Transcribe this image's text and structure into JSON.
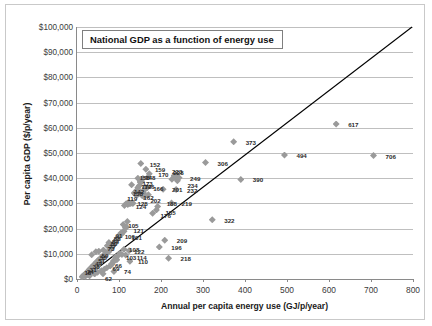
{
  "chart": {
    "title": "National GDP as a function of energy use",
    "xlabel": "Annual per capita energy use (GJ/p/year)",
    "ylabel": "Per capita GDP ($/p/year)"
  },
  "chart_data": {
    "type": "scatter",
    "title": "National GDP as a function of energy use",
    "xlabel": "Annual per capita energy use (GJ/p/year)",
    "ylabel": "Per capita GDP ($/p/year)",
    "xlim": [
      0,
      800
    ],
    "ylim": [
      0,
      100000
    ],
    "xticks": [
      0,
      100,
      200,
      300,
      400,
      500,
      600,
      700,
      800
    ],
    "yticks": [
      0,
      10000,
      20000,
      30000,
      40000,
      50000,
      60000,
      70000,
      80000,
      90000,
      100000
    ],
    "ytick_labels": [
      "$0",
      "$10,000",
      "$20,000",
      "$30,000",
      "$40,000",
      "$50,000",
      "$60,000",
      "$70,000",
      "$80,000",
      "$90,000",
      "$100,000"
    ],
    "xtick_labels": [
      "0",
      "100",
      "200",
      "300",
      "400",
      "500",
      "600",
      "700",
      "800"
    ],
    "grid": "horizontal",
    "legend": "none",
    "marker": "diamond",
    "marker_color": "#9a9a9a",
    "trendline": {
      "shown": true,
      "color": "#000000",
      "x": [
        18,
        800
      ],
      "y": [
        0,
        100000
      ]
    },
    "points": [
      {
        "label": "706",
        "x": 706,
        "y": 49000,
        "lx": 12,
        "ly": 0
      },
      {
        "label": "617",
        "x": 617,
        "y": 61500,
        "lx": 12,
        "ly": 0
      },
      {
        "label": "494",
        "x": 494,
        "y": 49200,
        "lx": 12,
        "ly": 0
      },
      {
        "label": "390",
        "x": 390,
        "y": 39500,
        "lx": 12,
        "ly": 0
      },
      {
        "label": "373",
        "x": 373,
        "y": 54500,
        "lx": 12,
        "ly": 0
      },
      {
        "label": "322",
        "x": 322,
        "y": 23500,
        "lx": 12,
        "ly": 0
      },
      {
        "label": "306",
        "x": 306,
        "y": 46200,
        "lx": 12,
        "ly": 0
      },
      {
        "label": "218",
        "x": 218,
        "y": 8200,
        "lx": 12,
        "ly": 0
      },
      {
        "label": "209",
        "x": 209,
        "y": 15400,
        "lx": 12,
        "ly": 0
      },
      {
        "label": "196",
        "x": 196,
        "y": 12700,
        "lx": 12,
        "ly": 0
      },
      {
        "label": "232",
        "x": 236,
        "y": 35500,
        "lx": 11,
        "ly": 0
      },
      {
        "label": "249",
        "x": 243,
        "y": 40200,
        "lx": 11,
        "ly": 0
      },
      {
        "label": "234",
        "x": 239,
        "y": 39000,
        "lx": 10,
        "ly": 4
      },
      {
        "label": "228",
        "x": 234,
        "y": 40400,
        "lx": -2,
        "ly": -5
      },
      {
        "label": "223",
        "x": 231,
        "y": 41000,
        "lx": -2,
        "ly": -5
      },
      {
        "label": "219",
        "x": 225,
        "y": 30200,
        "lx": 10,
        "ly": 0
      },
      {
        "label": "201",
        "x": 205,
        "y": 35600,
        "lx": 9,
        "ly": 0
      },
      {
        "label": "188",
        "x": 192,
        "y": 28800,
        "lx": 9,
        "ly": -3
      },
      {
        "label": "185",
        "x": 189,
        "y": 27400,
        "lx": 9,
        "ly": 2
      },
      {
        "label": "176",
        "x": 180,
        "y": 26100,
        "lx": 8,
        "ly": 2
      },
      {
        "label": "170",
        "x": 172,
        "y": 41800,
        "lx": 9,
        "ly": 0
      },
      {
        "label": "159",
        "x": 164,
        "y": 43600,
        "lx": 9,
        "ly": 0
      },
      {
        "label": "152",
        "x": 152,
        "y": 45800,
        "lx": 9,
        "ly": 0
      },
      {
        "label": "173",
        "x": 163,
        "y": 36300,
        "lx": -3,
        "ly": -5
      },
      {
        "label": "172",
        "x": 160,
        "y": 35200,
        "lx": -3,
        "ly": -4
      },
      {
        "label": "166",
        "x": 167,
        "y": 36200,
        "lx": 6,
        "ly": 0
      },
      {
        "label": "162",
        "x": 158,
        "y": 34200,
        "lx": 0,
        "ly": 4
      },
      {
        "label": "158",
        "x": 154,
        "y": 38600,
        "lx": -2,
        "ly": -5
      },
      {
        "label": "148",
        "x": 150,
        "y": 38500,
        "lx": 5,
        "ly": -5
      },
      {
        "label": "146",
        "x": 148,
        "y": 37000,
        "lx": 5,
        "ly": 0
      },
      {
        "label": "142",
        "x": 145,
        "y": 36300,
        "lx": -4,
        "ly": 3
      },
      {
        "label": "138",
        "x": 142,
        "y": 35200,
        "lx": -4,
        "ly": 3
      },
      {
        "label": "202",
        "x": 170,
        "y": 33400,
        "lx": 2,
        "ly": 5
      },
      {
        "label": "128",
        "x": 132,
        "y": 30300,
        "lx": 5,
        "ly": 0
      },
      {
        "label": "124",
        "x": 128,
        "y": 30000,
        "lx": 5,
        "ly": 3
      },
      {
        "label": "119",
        "x": 122,
        "y": 30400,
        "lx": -1,
        "ly": -4
      },
      {
        "label": "105",
        "x": 110,
        "y": 21600,
        "lx": 5,
        "ly": 0
      },
      {
        "label": "121",
        "x": 118,
        "y": 20600,
        "lx": 7,
        "ly": 3
      },
      {
        "label": "100",
        "x": 104,
        "y": 18200,
        "lx": 4,
        "ly": 3
      },
      {
        "label": "101",
        "x": 106,
        "y": 17800,
        "lx": 10,
        "ly": 3
      },
      {
        "label": "108",
        "x": 112,
        "y": 11800,
        "lx": 5,
        "ly": 0
      },
      {
        "label": "122",
        "x": 124,
        "y": 11200,
        "lx": 5,
        "ly": 0
      },
      {
        "label": "103",
        "x": 107,
        "y": 9700,
        "lx": 4,
        "ly": 2
      },
      {
        "label": "114",
        "x": 116,
        "y": 9500,
        "lx": 11,
        "ly": 2
      },
      {
        "label": "110",
        "x": 126,
        "y": 7000,
        "lx": 8,
        "ly": 0
      },
      {
        "label": "74",
        "x": 88,
        "y": 3000,
        "lx": 10,
        "ly": 0
      },
      {
        "label": "66",
        "x": 86,
        "y": 6600,
        "lx": 2,
        "ly": 3
      },
      {
        "label": "69",
        "x": 82,
        "y": 6000,
        "lx": 1,
        "ly": 4
      },
      {
        "label": "62",
        "x": 62,
        "y": 2100,
        "lx": 2,
        "ly": 4
      },
      {
        "label": "91",
        "x": 94,
        "y": 15700,
        "lx": -1,
        "ly": -4
      },
      {
        "label": "88",
        "x": 90,
        "y": 14800,
        "lx": -1,
        "ly": -4
      },
      {
        "label": "84",
        "x": 86,
        "y": 13600,
        "lx": -1,
        "ly": -4
      },
      {
        "label": "80",
        "x": 82,
        "y": 12600,
        "lx": -1,
        "ly": -4
      },
      {
        "label": "77",
        "x": 79,
        "y": 11600,
        "lx": -1,
        "ly": -4
      },
      {
        "label": "73",
        "x": 75,
        "y": 10700,
        "lx": -1,
        "ly": -4
      },
      {
        "label": "59",
        "x": 61,
        "y": 8100,
        "lx": -1,
        "ly": -4
      },
      {
        "label": "55",
        "x": 57,
        "y": 7200,
        "lx": -1,
        "ly": -4
      },
      {
        "label": "51",
        "x": 53,
        "y": 6100,
        "lx": -1,
        "ly": -4
      },
      {
        "label": "44",
        "x": 46,
        "y": 4600,
        "lx": -1,
        "ly": -4
      },
      {
        "label": "38",
        "x": 40,
        "y": 3400,
        "lx": -1,
        "ly": -4
      },
      {
        "label": "31",
        "x": 33,
        "y": 2500,
        "lx": -1,
        "ly": -4
      },
      {
        "label": "24",
        "x": 26,
        "y": 1700,
        "lx": -1,
        "ly": -4
      },
      {
        "label": "18",
        "x": 20,
        "y": 1100,
        "lx": -1,
        "ly": -4
      }
    ],
    "unlabeled_points": [
      {
        "x": 130,
        "y": 37400
      },
      {
        "x": 136,
        "y": 34100
      },
      {
        "x": 139,
        "y": 33600
      },
      {
        "x": 143,
        "y": 33200
      },
      {
        "x": 147,
        "y": 33900
      },
      {
        "x": 151,
        "y": 34600
      },
      {
        "x": 155,
        "y": 33100
      },
      {
        "x": 159,
        "y": 32700
      },
      {
        "x": 163,
        "y": 33000
      },
      {
        "x": 125,
        "y": 30000
      },
      {
        "x": 121,
        "y": 29600
      },
      {
        "x": 117,
        "y": 29900
      },
      {
        "x": 113,
        "y": 29200
      },
      {
        "x": 133,
        "y": 30000
      },
      {
        "x": 120,
        "y": 22800
      },
      {
        "x": 115,
        "y": 20300
      },
      {
        "x": 112,
        "y": 18900
      },
      {
        "x": 108,
        "y": 18500
      },
      {
        "x": 99,
        "y": 16900
      },
      {
        "x": 96,
        "y": 16100
      },
      {
        "x": 93,
        "y": 15200
      },
      {
        "x": 89,
        "y": 14100
      },
      {
        "x": 85,
        "y": 13100
      },
      {
        "x": 81,
        "y": 12100
      },
      {
        "x": 78,
        "y": 11500
      },
      {
        "x": 74,
        "y": 10900
      },
      {
        "x": 70,
        "y": 10300
      },
      {
        "x": 67,
        "y": 9900
      },
      {
        "x": 64,
        "y": 9400
      },
      {
        "x": 60,
        "y": 8900
      },
      {
        "x": 57,
        "y": 8400
      },
      {
        "x": 54,
        "y": 7900
      },
      {
        "x": 50,
        "y": 7300
      },
      {
        "x": 47,
        "y": 6800
      },
      {
        "x": 43,
        "y": 6200
      },
      {
        "x": 40,
        "y": 5600
      },
      {
        "x": 36,
        "y": 5000
      },
      {
        "x": 33,
        "y": 4400
      },
      {
        "x": 29,
        "y": 3800
      },
      {
        "x": 26,
        "y": 3100
      },
      {
        "x": 22,
        "y": 2500
      },
      {
        "x": 19,
        "y": 1900
      },
      {
        "x": 15,
        "y": 1400
      },
      {
        "x": 12,
        "y": 900
      },
      {
        "x": 35,
        "y": 9600
      },
      {
        "x": 45,
        "y": 10800
      },
      {
        "x": 52,
        "y": 11000
      },
      {
        "x": 63,
        "y": 11500
      },
      {
        "x": 72,
        "y": 13200
      },
      {
        "x": 76,
        "y": 14500
      },
      {
        "x": 98,
        "y": 9300
      },
      {
        "x": 102,
        "y": 10200
      },
      {
        "x": 92,
        "y": 8800
      },
      {
        "x": 95,
        "y": 7600
      },
      {
        "x": 87,
        "y": 7200
      },
      {
        "x": 83,
        "y": 5900
      },
      {
        "x": 79,
        "y": 5200
      },
      {
        "x": 71,
        "y": 4500
      },
      {
        "x": 65,
        "y": 3900
      },
      {
        "x": 58,
        "y": 3300
      },
      {
        "x": 49,
        "y": 2700
      },
      {
        "x": 42,
        "y": 2000
      },
      {
        "x": 30,
        "y": 1300
      },
      {
        "x": 170,
        "y": 40600
      },
      {
        "x": 226,
        "y": 39600
      },
      {
        "x": 238,
        "y": 41200
      },
      {
        "x": 145,
        "y": 40000
      },
      {
        "x": 157,
        "y": 39900
      }
    ]
  }
}
